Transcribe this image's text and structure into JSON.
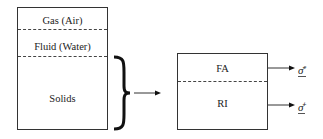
{
  "left_box": {
    "layers": [
      {
        "label": "Gas (Air)"
      },
      {
        "label": "Fluid (Water)"
      },
      {
        "label": "Solids"
      }
    ]
  },
  "right_box": {
    "layers": [
      {
        "label": "FA",
        "output": {
          "symbol": "σ̄",
          "superscript": "e"
        }
      },
      {
        "label": "RI",
        "output": {
          "symbol": "σ̄",
          "superscript": "i"
        }
      }
    ]
  }
}
